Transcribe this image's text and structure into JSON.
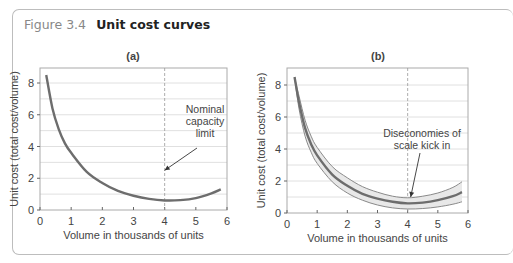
{
  "figure": {
    "number": "Figure 3.4",
    "title": "Unit cost curves"
  },
  "colors": {
    "curve": "#6d6d6d",
    "band_fill": "#e8e8e8",
    "band_edge": "#8a8a8a",
    "grid": "#d8d8d8",
    "frame": "#aaaaaa"
  },
  "chart_data": [
    {
      "type": "line",
      "panel_label": "(a)",
      "xlabel": "Volume in thousands of units",
      "ylabel": "Unit cost (total cost/volume)",
      "xlim": [
        0,
        6
      ],
      "ylim": [
        0,
        8.8
      ],
      "x_ticks": [
        "0",
        "1",
        "2",
        "3",
        "4",
        "5",
        "6"
      ],
      "y_ticks": [
        "0",
        "2",
        "4",
        "6",
        "8"
      ],
      "grid": "horizontal",
      "series": [
        {
          "name": "Unit cost",
          "x": [
            0.2,
            0.4,
            0.6,
            0.8,
            1.0,
            1.5,
            2.0,
            2.5,
            3.0,
            3.5,
            4.0,
            4.5,
            5.0,
            5.5,
            5.8
          ],
          "y": [
            8.5,
            6.4,
            5.1,
            4.2,
            3.6,
            2.4,
            1.7,
            1.2,
            0.9,
            0.7,
            0.6,
            0.62,
            0.75,
            1.05,
            1.3
          ]
        }
      ],
      "reference_line": {
        "x": 4,
        "style": "dashed"
      },
      "annotation": {
        "text_lines": [
          "Nominal",
          "capacity",
          "limit"
        ],
        "arrow_to": [
          4,
          2.5
        ]
      }
    },
    {
      "type": "line",
      "panel_label": "(b)",
      "xlabel": "Volume in thousands of units",
      "ylabel": "Unit cost (total cost/volume)",
      "xlim": [
        0,
        6
      ],
      "ylim": [
        0,
        8.8
      ],
      "x_ticks": [
        "0",
        "1",
        "2",
        "3",
        "4",
        "5",
        "6"
      ],
      "y_ticks": [
        "0",
        "2",
        "4",
        "6",
        "8"
      ],
      "grid": "horizontal",
      "series": [
        {
          "name": "Unit cost (central)",
          "x": [
            0.25,
            0.4,
            0.6,
            0.8,
            1.0,
            1.5,
            2.0,
            2.5,
            3.0,
            3.5,
            4.0,
            4.5,
            5.0,
            5.5,
            5.8
          ],
          "y": [
            8.5,
            6.9,
            5.3,
            4.3,
            3.6,
            2.4,
            1.7,
            1.2,
            0.9,
            0.7,
            0.6,
            0.65,
            0.8,
            1.05,
            1.3
          ]
        },
        {
          "name": "Upper band",
          "x": [
            0.25,
            0.4,
            0.6,
            0.8,
            1.0,
            1.5,
            2.0,
            2.5,
            3.0,
            3.5,
            4.0,
            4.5,
            5.0,
            5.5,
            5.8
          ],
          "y": [
            8.5,
            7.3,
            5.8,
            4.8,
            4.1,
            2.9,
            2.2,
            1.65,
            1.3,
            1.05,
            0.95,
            1.05,
            1.25,
            1.6,
            1.95
          ]
        },
        {
          "name": "Lower band",
          "x": [
            0.25,
            0.4,
            0.6,
            0.8,
            1.0,
            1.5,
            2.0,
            2.5,
            3.0,
            3.5,
            4.0,
            4.5,
            5.0,
            5.5,
            5.8
          ],
          "y": [
            8.5,
            6.5,
            4.8,
            3.8,
            3.1,
            1.95,
            1.25,
            0.8,
            0.5,
            0.32,
            0.25,
            0.28,
            0.38,
            0.55,
            0.7
          ]
        }
      ],
      "reference_line": {
        "x": 4,
        "style": "dashed"
      },
      "annotation": {
        "text_lines": [
          "Diseconomies of",
          "scale kick in"
        ],
        "arrow_to": [
          4.1,
          1.0
        ]
      }
    }
  ]
}
